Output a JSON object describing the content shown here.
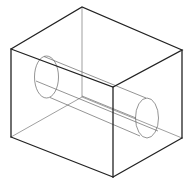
{
  "diagram": {
    "title": "",
    "colors": {
      "visible_edge": "#222222",
      "hidden_edge": "#777777",
      "cylinder": "#666666",
      "background": "#ffffff"
    },
    "box_vertices": {
      "top_back": [
        82,
        7
      ],
      "top_left": [
        11,
        49
      ],
      "top_right": [
        182,
        50
      ],
      "top_front": [
        113,
        87
      ],
      "bottom_left": [
        11,
        137
      ],
      "bottom_front": [
        113,
        177
      ],
      "bottom_right": [
        182,
        138
      ],
      "bottom_back_hidden": [
        82,
        97
      ]
    },
    "cylinder": {
      "left_face": {
        "cx": 46.5,
        "cy": 77,
        "rx": 12,
        "ry": 21
      },
      "right_face": {
        "cx": 147,
        "cy": 118,
        "rx": 11.5,
        "ry": 20
      }
    }
  }
}
